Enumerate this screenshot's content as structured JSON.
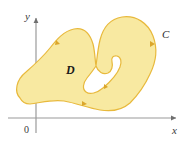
{
  "figure": {
    "title_alt": "Simply connected region D bounded by positively oriented closed curve C in the xy-plane",
    "background_color": "#ffffff",
    "axes": {
      "x_axis": {
        "label": "x",
        "label_style": "italic",
        "color": "#8a8a8a",
        "y_position": 118,
        "x_start": 8,
        "x_end": 182,
        "arrow": "right"
      },
      "y_axis": {
        "label": "y",
        "label_style": "italic",
        "color": "#8a8a8a",
        "x_position": 36,
        "y_start": 133,
        "y_end": 12,
        "arrow": "up"
      },
      "origin": {
        "label": "0",
        "x": 27,
        "y": 131
      }
    },
    "region": {
      "label": "D",
      "label_x": 66,
      "label_y": 70,
      "fill_color": "#f8e9a1",
      "stroke_color": "#e8b93c",
      "stroke_width": 1.1
    },
    "curve": {
      "label": "C",
      "label_x": 163,
      "label_y": 35,
      "orientation": "counterclockwise",
      "orientation_markers": 4
    }
  }
}
